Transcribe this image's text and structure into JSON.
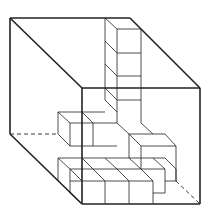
{
  "diagram": {
    "stroke_color": "#222222",
    "outer_cube": {
      "solid": [
        [
          10,
          18,
          130,
          18
        ],
        [
          10,
          18,
          10,
          134
        ],
        [
          10,
          18,
          82,
          88
        ],
        [
          130,
          18,
          200,
          88
        ],
        [
          82,
          88,
          200,
          88
        ],
        [
          82,
          88,
          82,
          204
        ],
        [
          200,
          88,
          200,
          204
        ],
        [
          82,
          204,
          200,
          204
        ],
        [
          10,
          134,
          82,
          204
        ]
      ],
      "dashed": [
        [
          10,
          134,
          58,
          134
        ],
        [
          176,
          181,
          200,
          204
        ]
      ]
    },
    "inner_lines": [
      [
        105,
        18,
        105,
        100
      ],
      [
        117,
        29,
        141,
        29
      ],
      [
        117,
        29,
        117,
        123
      ],
      [
        141,
        29,
        141,
        123
      ],
      [
        105,
        18,
        117,
        29
      ],
      [
        117,
        53,
        141,
        53
      ],
      [
        105,
        41,
        117,
        53
      ],
      [
        117,
        76,
        141,
        76
      ],
      [
        105,
        64,
        117,
        76
      ],
      [
        117,
        100,
        141,
        100
      ],
      [
        105,
        88,
        117,
        100
      ],
      [
        105,
        100,
        117,
        112
      ],
      [
        58,
        112,
        105,
        112
      ],
      [
        58,
        112,
        70,
        123
      ],
      [
        70,
        123,
        117,
        123
      ],
      [
        58,
        112,
        58,
        134
      ],
      [
        70,
        123,
        70,
        146
      ],
      [
        93,
        123,
        93,
        146
      ],
      [
        82,
        112,
        93,
        123
      ],
      [
        70,
        146,
        117,
        146
      ],
      [
        58,
        134,
        70,
        146
      ],
      [
        117,
        123,
        129,
        134
      ],
      [
        141,
        123,
        153,
        134
      ],
      [
        129,
        134,
        165,
        134
      ],
      [
        129,
        134,
        129,
        158
      ],
      [
        165,
        134,
        176,
        146
      ],
      [
        141,
        146,
        176,
        146
      ],
      [
        141,
        146,
        141,
        169
      ],
      [
        176,
        146,
        176,
        181
      ],
      [
        129,
        134,
        141,
        146
      ],
      [
        58,
        158,
        165,
        158
      ],
      [
        58,
        158,
        70,
        169
      ],
      [
        58,
        158,
        58,
        181
      ],
      [
        82,
        158,
        93,
        169
      ],
      [
        105,
        158,
        117,
        169
      ],
      [
        129,
        158,
        141,
        169
      ],
      [
        70,
        169,
        165,
        169
      ],
      [
        70,
        169,
        70,
        193
      ],
      [
        165,
        169,
        165,
        193
      ],
      [
        153,
        158,
        165,
        169
      ],
      [
        70,
        181,
        82,
        181
      ],
      [
        82,
        181,
        153,
        181
      ],
      [
        70,
        193,
        82,
        204
      ],
      [
        105,
        181,
        105,
        204
      ],
      [
        129,
        181,
        129,
        204
      ],
      [
        153,
        181,
        153,
        204
      ],
      [
        153,
        193,
        165,
        193
      ],
      [
        141,
        169,
        153,
        181
      ],
      [
        117,
        169,
        129,
        181
      ],
      [
        93,
        169,
        105,
        181
      ],
      [
        70,
        169,
        82,
        181
      ],
      [
        165,
        158,
        176,
        169
      ],
      [
        176,
        169,
        176,
        181
      ],
      [
        165,
        181,
        176,
        181
      ]
    ]
  }
}
